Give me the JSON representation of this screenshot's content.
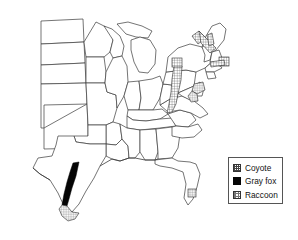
{
  "figure": {
    "type": "choropleth-map",
    "region": "Continental United States (eastern and central)",
    "background_color": "#ffffff",
    "outline_color": "#3a3a3a"
  },
  "legend": {
    "position": "bottom-right",
    "border_color": "#555555",
    "background_color": "#ffffff",
    "items": [
      {
        "label": "Coyote",
        "swatch": "grid-hatch-pattern",
        "swatch_key": "coyote",
        "color": "#444444"
      },
      {
        "label": "Gray fox",
        "swatch": "solid-black-fill",
        "swatch_key": "grayfox",
        "color": "#050505"
      },
      {
        "label": "Raccoon",
        "swatch": "fine-checker-pattern",
        "swatch_key": "raccoon",
        "color": "#777777"
      }
    ]
  },
  "zones": [
    {
      "id": "zone-coyote-ohio-wv",
      "species": "Coyote",
      "area": "Ohio / West Virginia corridor"
    },
    {
      "id": "zone-coyote-lake-erie",
      "species": "Coyote",
      "area": "Lake Erie shore patch"
    },
    {
      "id": "zone-coyote-upstate-ny",
      "species": "Coyote",
      "area": "Upstate New York diagonal band"
    },
    {
      "id": "zone-coyote-vermont",
      "species": "Coyote",
      "area": "Vermont"
    },
    {
      "id": "zone-coyote-massachusetts",
      "species": "Coyote",
      "area": "Eastern Massachusetts"
    },
    {
      "id": "zone-coyote-connecticut",
      "species": "Coyote",
      "area": "Connecticut / Rhode Island"
    },
    {
      "id": "zone-grayfox-texas",
      "species": "Gray fox",
      "area": "Central Texas band"
    },
    {
      "id": "zone-raccoon-maryland",
      "species": "Raccoon",
      "area": "Maryland / Delaware / Chesapeake"
    },
    {
      "id": "zone-raccoon-south-texas",
      "species": "Raccoon",
      "area": "South Texas Gulf coast"
    },
    {
      "id": "zone-raccoon-florida",
      "species": "Raccoon",
      "area": "Central Florida patch"
    }
  ]
}
